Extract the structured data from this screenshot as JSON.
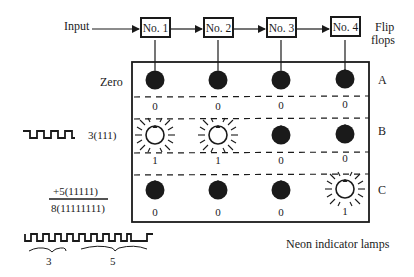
{
  "input_label": "Input",
  "flip_flops": {
    "label_line1": "Flip",
    "label_line2": "flops",
    "boxes": [
      "No. 1",
      "No. 2",
      "No. 3",
      "No. 4"
    ]
  },
  "rows": [
    {
      "name": "A",
      "side_label": "Zero",
      "lamps": [
        "off",
        "off",
        "off",
        "off"
      ],
      "values": [
        "0",
        "0",
        "0",
        "0"
      ]
    },
    {
      "name": "B",
      "side_label": "3(111)",
      "lamps": [
        "on",
        "on",
        "off",
        "off"
      ],
      "values": [
        "1",
        "1",
        "0",
        "0"
      ]
    },
    {
      "name": "C",
      "side_label": "",
      "lamps": [
        "off",
        "off",
        "off",
        "on"
      ],
      "values": [
        "0",
        "0",
        "0",
        "1"
      ]
    }
  ],
  "addition": {
    "addend": "+5(11111)",
    "sum": "8(11111111)"
  },
  "pulse_train_labels": [
    "3",
    "5"
  ],
  "caption": "Neon indicator lamps"
}
